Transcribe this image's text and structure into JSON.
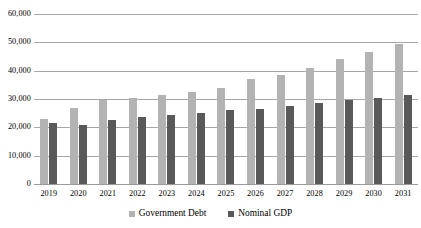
{
  "chart_data": {
    "type": "bar",
    "title": "",
    "xlabel": "",
    "ylabel": "",
    "ylim": [
      0,
      60000
    ],
    "ytick_labels": [
      "60,000",
      "50,000",
      "40,000",
      "30,000",
      "20,000",
      "10,000",
      "0"
    ],
    "ytick_values": [
      60000,
      50000,
      40000,
      30000,
      20000,
      10000,
      0
    ],
    "grid": true,
    "legend_position": "bottom",
    "categories": [
      "2019",
      "2020",
      "2021",
      "2022",
      "2023",
      "2024",
      "2025",
      "2026",
      "2027",
      "2028",
      "2029",
      "2030",
      "2031"
    ],
    "series": [
      {
        "name": "Government Debt",
        "color": "#b3b3b3",
        "values": [
          23000,
          27000,
          29500,
          30500,
          31500,
          32500,
          34000,
          37000,
          38500,
          41000,
          44000,
          46500,
          49500
        ]
      },
      {
        "name": "Nominal GDP",
        "color": "#595959",
        "values": [
          21500,
          21000,
          22500,
          23500,
          24500,
          25000,
          26000,
          26500,
          27500,
          28500,
          29500,
          30500,
          31500
        ]
      }
    ]
  },
  "legend": {
    "items": [
      {
        "label": "Government Debt",
        "marker": "square-marker-light"
      },
      {
        "label": "Nominal GDP",
        "marker": "square-marker-dark"
      }
    ]
  }
}
